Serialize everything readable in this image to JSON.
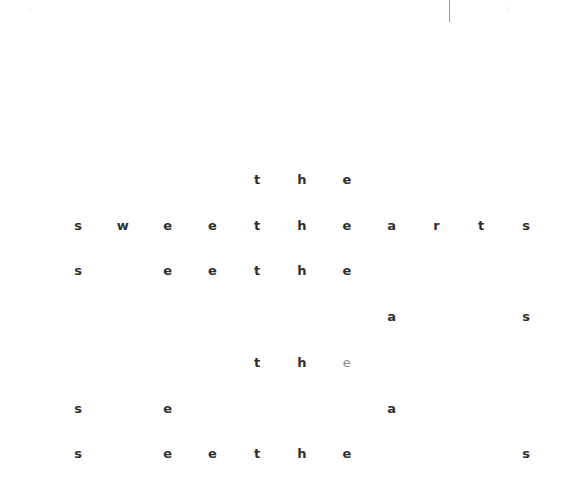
{
  "header": {
    "back_icon": "chevron-left-icon",
    "back_glyph": "‹",
    "caption": "",
    "next_icon": "chevron-right-icon",
    "next_glyph": "›"
  },
  "puzzle": {
    "columns": 11,
    "rows": [
      [
        "",
        "",
        "",
        "",
        "t",
        "h",
        "e",
        "",
        "",
        "",
        ""
      ],
      [
        "s",
        "w",
        "e",
        "e",
        "t",
        "h",
        "e",
        "a",
        "r",
        "t",
        "s"
      ],
      [
        "s",
        "",
        "e",
        "e",
        "t",
        "h",
        "e",
        "",
        "",
        "",
        ""
      ],
      [
        "",
        "",
        "",
        "",
        "",
        "",
        "",
        "a",
        "",
        "",
        "s"
      ],
      [
        "",
        "",
        "",
        "",
        "t",
        "h",
        "e",
        "",
        "",
        "",
        ""
      ],
      [
        "s",
        "",
        "e",
        "",
        "",
        "",
        "",
        "a",
        "",
        "",
        ""
      ],
      [
        "s",
        "",
        "e",
        "e",
        "t",
        "h",
        "e",
        "",
        "",
        "",
        "s"
      ]
    ],
    "faded_cells": [
      [
        4,
        6
      ]
    ]
  }
}
